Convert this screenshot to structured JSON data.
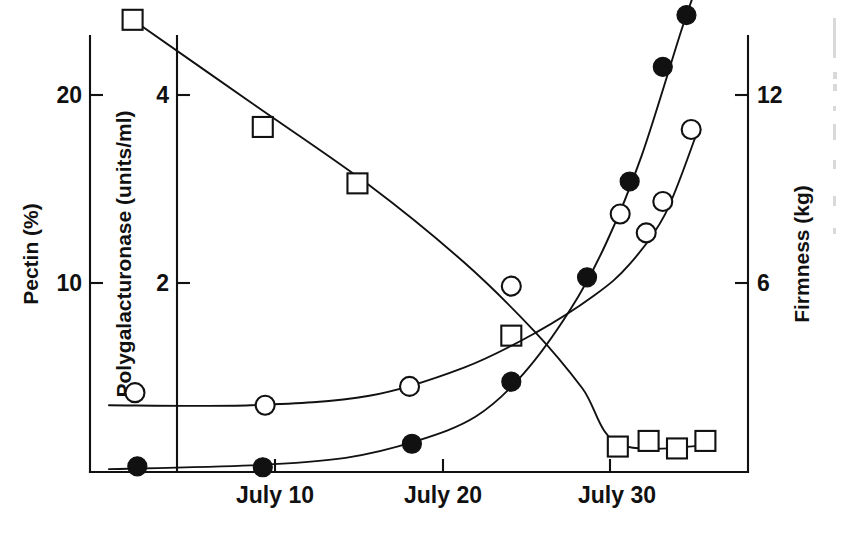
{
  "figure": {
    "background_color": "#ffffff",
    "ink_color": "#111111"
  },
  "axes": {
    "left_outer": {
      "title": "Pectin  (%)",
      "name": "pectin-axis",
      "ticks": [
        {
          "label": "10",
          "value": 10
        },
        {
          "label": "20",
          "value": 20
        }
      ]
    },
    "left_inner": {
      "title": "Polygalacturonase  (units/ml)",
      "name": "polygalacturonase-axis",
      "ticks": [
        {
          "label": "2",
          "value": 2
        },
        {
          "label": "4",
          "value": 4
        }
      ]
    },
    "right": {
      "title": "Firmness (kg)",
      "name": "firmness-axis",
      "ticks": [
        {
          "label": "6",
          "value": 6
        },
        {
          "label": "12",
          "value": 12
        }
      ]
    },
    "bottom": {
      "title": "",
      "name": "date-axis",
      "ticks": [
        {
          "label": "July  10",
          "value": 10
        },
        {
          "label": "July  20",
          "value": 20
        },
        {
          "label": "July 30",
          "value": 30
        }
      ]
    }
  },
  "chart_data": {
    "type": "scatter",
    "title": "",
    "subtitle": "",
    "xlabel": "",
    "ylabel": "",
    "grid": false,
    "legend": "none",
    "x_tick_labels": [
      "July  10",
      "July  20",
      "July 30"
    ],
    "x_tick_values": [
      10,
      20,
      30
    ],
    "xlim": [
      5.2,
      33.0
    ],
    "series": [
      {
        "name": "Pectin",
        "marker": "open-square",
        "axis": "left_outer",
        "units": "%",
        "ylim": [
          0,
          29.2
        ],
        "y_tick_values": [
          10,
          20
        ],
        "x": [
          7,
          12.5,
          16.5,
          23,
          27.5,
          28.8,
          30.0,
          31.2
        ],
        "values": [
          24.0,
          18.3,
          15.3,
          7.2,
          1.3,
          1.6,
          1.2,
          1.6
        ],
        "fit_curve": [
          {
            "x": 7.0,
            "y": 24.0
          },
          {
            "x": 12.0,
            "y": 19.6
          },
          {
            "x": 17.0,
            "y": 15.2
          },
          {
            "x": 21.0,
            "y": 11.1
          },
          {
            "x": 24.0,
            "y": 7.4
          },
          {
            "x": 26.0,
            "y": 4.4
          },
          {
            "x": 27.6,
            "y": 1.4
          },
          {
            "x": 31.6,
            "y": 1.4
          }
        ]
      },
      {
        "name": "Polygalacturonase",
        "marker": "filled-circle",
        "axis": "left_inner",
        "units": "units/ml",
        "ylim": [
          0,
          5.85
        ],
        "y_tick_values": [
          2,
          4
        ],
        "x": [
          7.2,
          12.5,
          18.8,
          23.0,
          26.2,
          28.0,
          29.4,
          30.4,
          27.8
        ],
        "values": [
          0.05,
          0.04,
          0.29,
          0.95,
          2.06,
          3.08,
          4.3,
          4.85,
          5.55
        ],
        "fit_curve": [
          {
            "x": 6.0,
            "y": 0.02
          },
          {
            "x": 12.0,
            "y": 0.06
          },
          {
            "x": 16.0,
            "y": 0.14
          },
          {
            "x": 19.0,
            "y": 0.32
          },
          {
            "x": 21.5,
            "y": 0.58
          },
          {
            "x": 23.5,
            "y": 1.03
          },
          {
            "x": 25.5,
            "y": 1.72
          },
          {
            "x": 27.0,
            "y": 2.42
          },
          {
            "x": 28.5,
            "y": 3.35
          },
          {
            "x": 30.2,
            "y": 4.7
          },
          {
            "x": 30.9,
            "y": 5.2
          }
        ]
      },
      {
        "name": "Firmness",
        "marker": "open-circle",
        "axis": "right",
        "units": "kg",
        "ylim": [
          0,
          17.5
        ],
        "y_tick_values": [
          6,
          12
        ],
        "x": [
          7.1,
          12.6,
          18.7,
          23.0,
          27.6,
          28.7,
          29.4,
          30.6
        ],
        "values": [
          2.5,
          2.1,
          2.7,
          5.9,
          8.2,
          7.6,
          8.6,
          10.9
        ],
        "fit_curve": [
          {
            "x": 6.0,
            "y": 2.1
          },
          {
            "x": 12.0,
            "y": 2.1
          },
          {
            "x": 17.0,
            "y": 2.4
          },
          {
            "x": 21.0,
            "y": 3.3
          },
          {
            "x": 24.0,
            "y": 4.4
          },
          {
            "x": 26.5,
            "y": 5.6
          },
          {
            "x": 28.0,
            "y": 6.6
          },
          {
            "x": 29.5,
            "y": 8.2
          },
          {
            "x": 30.8,
            "y": 10.7
          }
        ]
      }
    ]
  }
}
